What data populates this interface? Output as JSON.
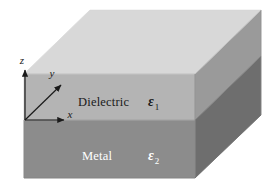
{
  "figure": {
    "background_color": "#ffffff"
  },
  "axes": {
    "origin_label": "",
    "items": [
      {
        "name": "z-axis",
        "label": "z",
        "direction": "vertical-up",
        "label_x": 24,
        "label_y": 62
      },
      {
        "name": "y-axis",
        "label": "y",
        "direction": "diagonal-up-right",
        "label_x": 51,
        "label_y": 75
      },
      {
        "name": "x-axis",
        "label": "x",
        "direction": "horizontal-right",
        "label_x": 70,
        "label_y": 119
      }
    ],
    "line_color": "#1a1a1a"
  },
  "layers": [
    {
      "name": "dielectric",
      "label": "Dielectric",
      "permittivity_symbol": "ε",
      "permittivity_subscript": "1",
      "label_color": "#1a1a1a",
      "front_color": "#b4b4b4",
      "top_color": "#d8d8d8",
      "side_color": "#9a9a9a",
      "label_x": 78,
      "label_y": 102,
      "eps_x": 148,
      "eps_y": 103
    },
    {
      "name": "metal",
      "label": "Metal",
      "permittivity_symbol": "ε",
      "permittivity_subscript": "2",
      "label_color": "#ffffff",
      "front_color": "#8c8c8c",
      "side_color": "#6e6e6e",
      "label_x": 82,
      "label_y": 156,
      "eps_x": 148,
      "eps_y": 157
    }
  ],
  "colors": {
    "top_face": "#d8d8d8",
    "dielectric_front": "#b4b4b4",
    "dielectric_side": "#9a9a9a",
    "metal_front": "#8c8c8c",
    "metal_side": "#6e6e6e",
    "edge_line": "#9c9c9c",
    "axis_line": "#1a1a1a",
    "text_dark": "#1a1a1a",
    "text_light": "#ffffff"
  },
  "geometry": {
    "front_left_x": 24,
    "front_right_x": 195,
    "interface_y": 120,
    "top_front_y": 74,
    "bottom_y": 178,
    "depth_dx": 66,
    "depth_dy": -64
  }
}
